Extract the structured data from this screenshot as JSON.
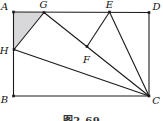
{
  "figure": {
    "caption": "图2-69",
    "colors": {
      "background": "#ffffff",
      "line": "#1a1a1a",
      "shade": "#d8d8da",
      "label": "#111111"
    },
    "points": {
      "A": {
        "x": 13.5,
        "y": 12,
        "label_x": 4.5,
        "label_y": 6.5
      },
      "B": {
        "x": 13.5,
        "y": 96,
        "label_x": 4.5,
        "label_y": 99
      },
      "C": {
        "x": 149,
        "y": 96,
        "label_x": 156,
        "label_y": 100.5
      },
      "D": {
        "x": 149,
        "y": 12.5,
        "label_x": 156.5,
        "label_y": 6.5
      },
      "E": {
        "x": 109.5,
        "y": 12,
        "label_x": 109.5,
        "label_y": 4.5
      },
      "F": {
        "x": 87,
        "y": 46.5,
        "label_x": 86.5,
        "label_y": 59.5
      },
      "G": {
        "x": 44,
        "y": 12.5,
        "label_x": 43.5,
        "label_y": 4.5
      },
      "H": {
        "x": 14,
        "y": 49.5,
        "label_x": 4,
        "label_y": 50
      }
    },
    "shaded_triangle": [
      "A",
      "G",
      "H"
    ],
    "rectangle_edges": [
      [
        "A",
        "D"
      ],
      [
        "D",
        "C"
      ],
      [
        "B",
        "C"
      ],
      [
        "A",
        "B"
      ]
    ],
    "segments": [
      [
        "H",
        "G"
      ],
      [
        "G",
        "C"
      ],
      [
        "E",
        "F"
      ],
      [
        "E",
        "C"
      ],
      [
        "H",
        "C"
      ]
    ],
    "dots": [
      "A",
      "B",
      "C",
      "D",
      "E",
      "F",
      "G",
      "H"
    ],
    "dot_size": 2.6,
    "stroke_width": 1.1
  }
}
